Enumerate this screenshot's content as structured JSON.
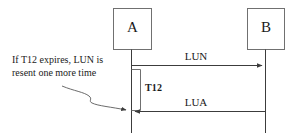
{
  "diagram": {
    "type": "sequence-diagram",
    "title": "",
    "background_color": "#ffffff",
    "line_color": "#3c3c3c",
    "text_color": "#1a1a1a",
    "actors": [
      {
        "id": "a",
        "label": "A",
        "x": 131
      },
      {
        "id": "b",
        "label": "B",
        "x": 265
      }
    ],
    "messages": [
      {
        "id": "lun",
        "label": "LUN",
        "from": "a",
        "to": "b",
        "direction": "right",
        "y": 65
      },
      {
        "id": "lua",
        "label": "LUA",
        "from": "b",
        "to": "a",
        "direction": "left",
        "y": 111
      }
    ],
    "timer": {
      "label": "T12",
      "start_y": 69,
      "end_y": 110
    },
    "note": {
      "line1": "If T12 expires, LUN is",
      "line2": "resent one more time",
      "leader": "curved-arrow-to-lifeline-a"
    }
  }
}
